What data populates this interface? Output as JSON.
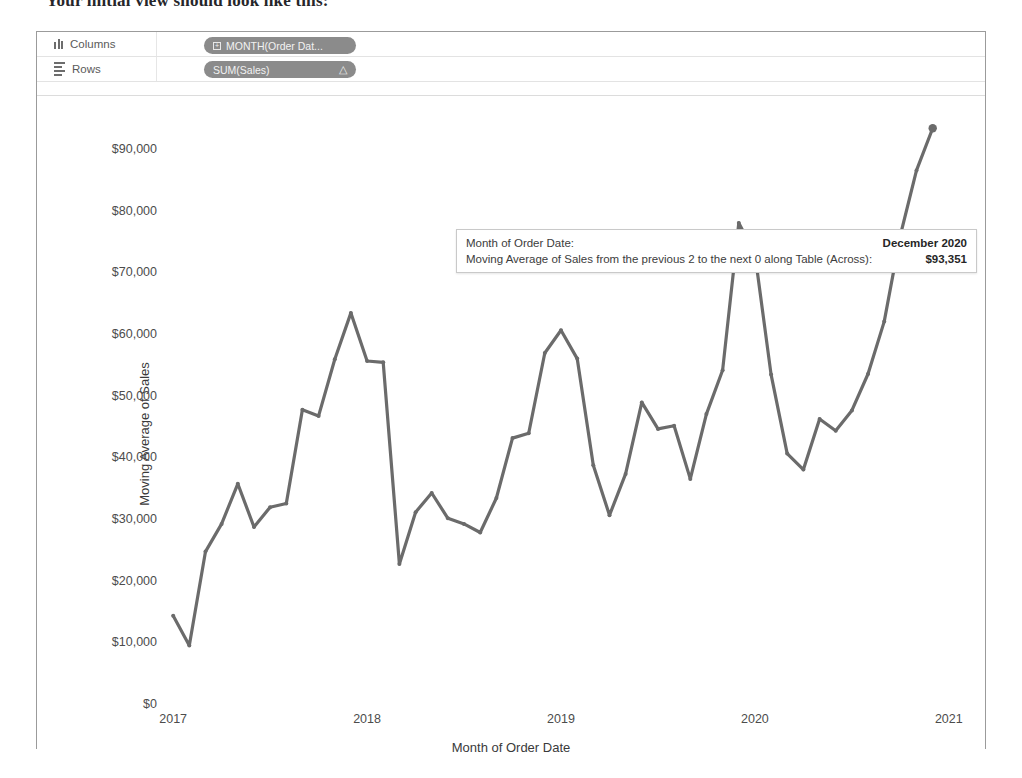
{
  "caption": "Your initial view should look like this:",
  "shelves": [
    {
      "name": "columns",
      "label": "Columns",
      "icon": "columns-icon",
      "pill": "MONTH(Order Dat...",
      "has_plus": true,
      "has_delta": false
    },
    {
      "name": "rows",
      "label": "Rows",
      "icon": "rows-icon",
      "pill": "SUM(Sales)",
      "has_plus": false,
      "has_delta": true,
      "delta": "△"
    }
  ],
  "tooltip": {
    "rows": [
      {
        "key": "Month of Order Date:",
        "value": "December 2020"
      },
      {
        "key": "Moving Average of Sales from the previous 2 to the next 0 along Table (Across):",
        "value": "$93,351"
      }
    ]
  },
  "colors": {
    "line": "#6b6b6b",
    "axis_text": "#4c4c4c",
    "pill": "#8b8b8b",
    "frame": "#9b9b9b"
  },
  "chart_data": {
    "type": "line",
    "title": "",
    "xlabel": "Month of Order Date",
    "ylabel": "Moving Average of Sales",
    "ylim": [
      0,
      95000
    ],
    "yticks": [
      "$0",
      "$10,000",
      "$20,000",
      "$30,000",
      "$40,000",
      "$50,000",
      "$60,000",
      "$70,000",
      "$80,000",
      "$90,000"
    ],
    "ytick_values": [
      0,
      10000,
      20000,
      30000,
      40000,
      50000,
      60000,
      70000,
      80000,
      90000
    ],
    "xticks": [
      "2017",
      "2018",
      "2019",
      "2020",
      "2021"
    ],
    "xtick_values": [
      2017,
      2018,
      2019,
      2020,
      2021
    ],
    "grid": false,
    "legend": "none",
    "series": [
      {
        "name": "Moving Average of Sales",
        "x": [
          "2017-01",
          "2017-02",
          "2017-03",
          "2017-04",
          "2017-05",
          "2017-06",
          "2017-07",
          "2017-08",
          "2017-09",
          "2017-10",
          "2017-11",
          "2017-12",
          "2018-01",
          "2018-02",
          "2018-03",
          "2018-04",
          "2018-05",
          "2018-06",
          "2018-07",
          "2018-08",
          "2018-09",
          "2018-10",
          "2018-11",
          "2018-12",
          "2019-01",
          "2019-02",
          "2019-03",
          "2019-04",
          "2019-05",
          "2019-06",
          "2019-07",
          "2019-08",
          "2019-09",
          "2019-10",
          "2019-11",
          "2019-12",
          "2020-01",
          "2020-02",
          "2020-03",
          "2020-04",
          "2020-05",
          "2020-06",
          "2020-07",
          "2020-08",
          "2020-09",
          "2020-10",
          "2020-11",
          "2020-12"
        ],
        "values": [
          14300,
          9500,
          24700,
          29200,
          35700,
          28700,
          31900,
          32500,
          47700,
          46700,
          55900,
          63400,
          55600,
          55400,
          22700,
          31100,
          34200,
          30100,
          29200,
          27800,
          33400,
          43100,
          43900,
          56900,
          60600,
          56000,
          38700,
          30600,
          37300,
          48900,
          44600,
          45100,
          36500,
          47000,
          54100,
          78000,
          73000,
          53400,
          40600,
          38000,
          46200,
          44300,
          47600,
          53500,
          62000,
          76000,
          86500,
          93351
        ]
      }
    ],
    "highlight": {
      "x": "2020-12",
      "label": "December 2020",
      "value": 93351,
      "value_label": "$93,351"
    }
  }
}
